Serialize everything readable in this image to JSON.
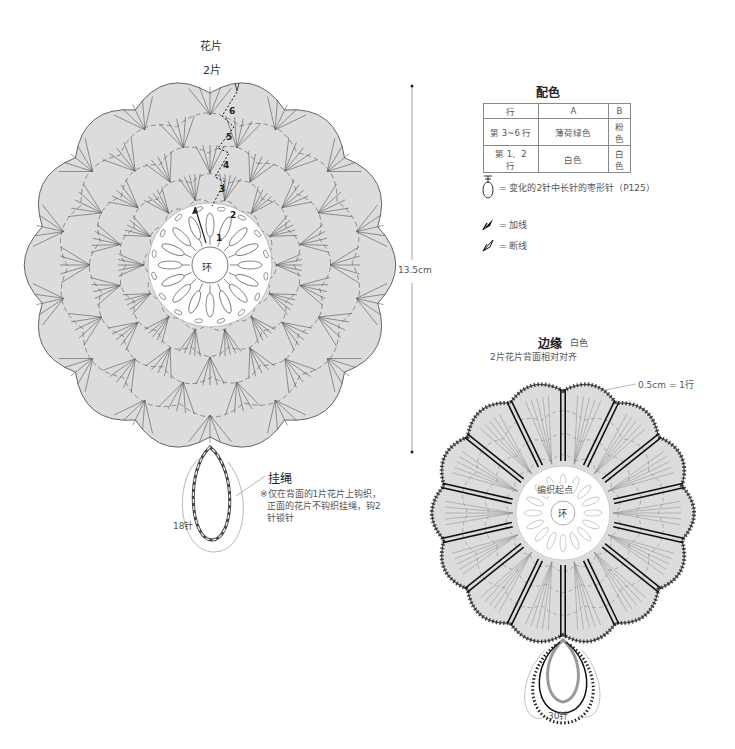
{
  "flower_piece": {
    "title": "花片",
    "count": "2片",
    "center_label": "环",
    "row_numbers": [
      "1",
      "2",
      "3",
      "4",
      "5",
      "6"
    ],
    "scallops": 14,
    "fill_color": "#dcdcdc",
    "height_dimension": "13.5cm"
  },
  "hanging_loop": {
    "title": "挂绳",
    "note_line1": "※仅在背面的1片花片上钩织，",
    "note_line2": "正面的花片不钩织挂绳，钩2",
    "note_line3": "针锁针",
    "stitch_count": "18针"
  },
  "color_table": {
    "title": "配色",
    "headers": [
      "行",
      "A",
      "B"
    ],
    "rows": [
      [
        "第 3~6 行",
        "薄荷绿色",
        "粉色"
      ],
      [
        "第 1、2 行",
        "白色",
        "白色"
      ]
    ]
  },
  "legend": {
    "items": [
      {
        "icon": "oval-stitch-icon",
        "label": "= 变化的2针中长针的枣形针（P125）"
      },
      {
        "icon": "join-yarn-icon",
        "label": "= 加线"
      },
      {
        "icon": "cut-yarn-icon",
        "label": "= 断线"
      }
    ]
  },
  "border_piece": {
    "title": "边缘",
    "color_label": "白色",
    "subtitle": "2片花片背面相对对齐",
    "row_note": "0.5cm = 1行",
    "start_label": "编织起点",
    "center_label": "环",
    "loop_stitch_count": "30针",
    "scallops": 14,
    "spokes": 14
  }
}
